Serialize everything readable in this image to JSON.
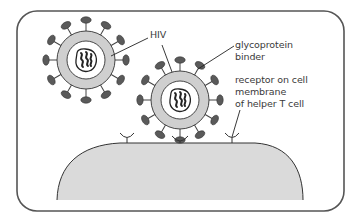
{
  "diagram": {
    "type": "labeled-biology-illustration",
    "colors": {
      "frame_stroke": "#555555",
      "cell_fill": "#dadada",
      "capsid_ring": "#cfcfcf",
      "glycoprotein": "#5a5a5a",
      "outline": "#333333"
    },
    "labels": {
      "hiv": "HIV",
      "glycoprotein_line1": "glycoprotein",
      "glycoprotein_line2": "binder",
      "receptor_line1": "receptor on cell",
      "receptor_line2": "membrane",
      "receptor_line3": "of helper T cell"
    },
    "elements": [
      {
        "name": "hiv-particle-1",
        "description": "free HIV particle with glycoprotein spikes"
      },
      {
        "name": "hiv-particle-2",
        "description": "HIV particle binding to receptor via glycoprotein"
      },
      {
        "name": "helper-t-cell",
        "description": "helper T cell surface with receptors"
      }
    ]
  }
}
